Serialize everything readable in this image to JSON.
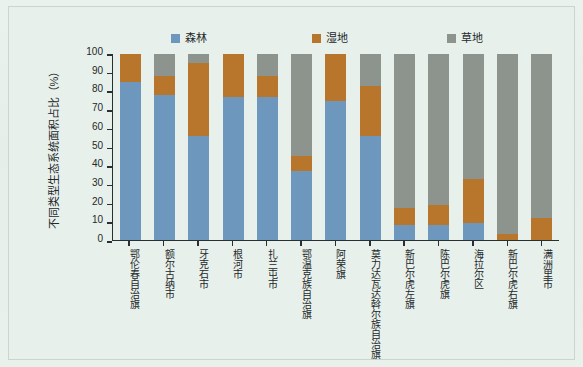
{
  "chart_data": {
    "type": "bar",
    "stacked": true,
    "title": "",
    "xlabel": "",
    "ylabel": "不同类型生态系统面积占比（%）",
    "ylim": [
      0,
      100
    ],
    "yticks": [
      0,
      10,
      20,
      30,
      40,
      50,
      60,
      70,
      80,
      90,
      100
    ],
    "grid": false,
    "legend_position": "top",
    "categories": [
      "鄂伦春自治旗",
      "额尔古纳市",
      "牙克石市",
      "根河市",
      "扎兰屯市",
      "鄂温克族自治旗",
      "阿荣旗",
      "莫力达瓦达斡尔族自治旗",
      "新巴尔虎左旗",
      "陈巴尔虎旗",
      "海拉尔区",
      "新巴尔虎右旗",
      "满洲里市"
    ],
    "series": [
      {
        "name": "森林",
        "color": "#6d97bd",
        "values": [
          85,
          78,
          56,
          77,
          77,
          37,
          75,
          56,
          8,
          8,
          9,
          0,
          0
        ]
      },
      {
        "name": "湿地",
        "color": "#b8762c",
        "values": [
          15,
          10,
          39,
          23,
          11,
          8,
          25,
          27,
          9,
          11,
          24,
          3,
          12
        ]
      },
      {
        "name": "草地",
        "color": "#8d948d",
        "values": [
          0,
          12,
          5,
          0,
          12,
          55,
          0,
          17,
          83,
          81,
          67,
          97,
          88
        ]
      }
    ]
  },
  "legend": {
    "items": [
      {
        "label": "森林",
        "color": "#6d97bd",
        "swatch": "legend-swatch-forest"
      },
      {
        "label": "湿地",
        "color": "#b8762c",
        "swatch": "legend-swatch-wetland"
      },
      {
        "label": "草地",
        "color": "#8d948d",
        "swatch": "legend-swatch-grassland"
      }
    ]
  },
  "axis": {
    "y_title": "不同类型生态系统面积占比（%）",
    "y_tick_labels": [
      "100",
      "90",
      "80",
      "70",
      "60",
      "50",
      "40",
      "30",
      "20",
      "10",
      "0"
    ]
  }
}
